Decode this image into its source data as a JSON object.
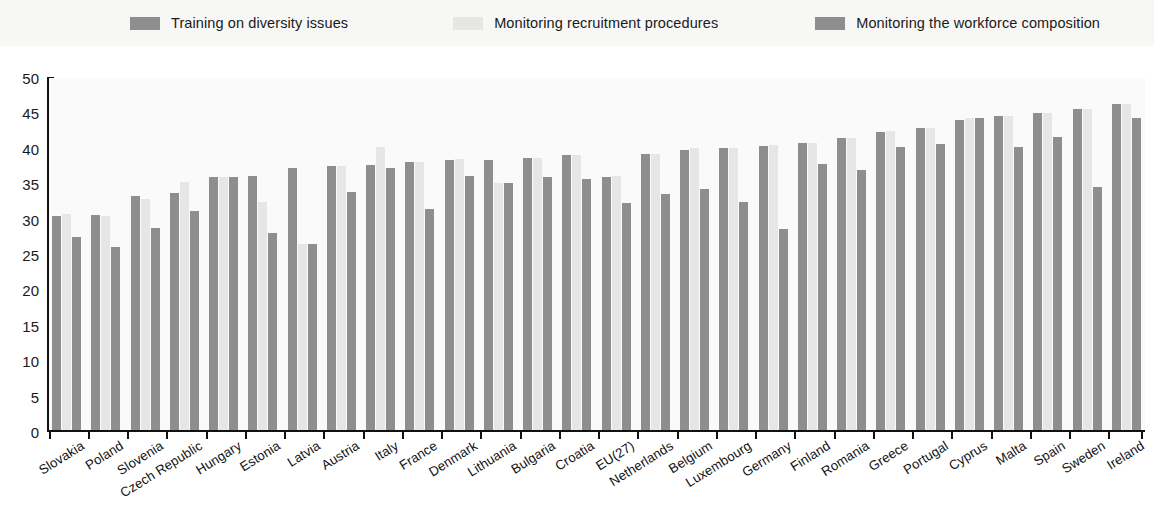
{
  "legend": {
    "entries": [
      {
        "label": "Training on diversity issues",
        "color": "#8e8e8e"
      },
      {
        "label": "Monitoring recruitment procedures",
        "color": "#e6e6e4"
      },
      {
        "label": "Monitoring the workforce composition",
        "color": "#8e8e8e"
      }
    ]
  },
  "axis": {
    "y_ticks": [
      "50",
      "45",
      "40",
      "35",
      "30",
      "25",
      "20",
      "15",
      "10",
      "5",
      "0"
    ]
  },
  "chart_data": {
    "type": "bar",
    "title": "",
    "subtitle": "",
    "xlabel": "",
    "ylabel": "",
    "ylim": [
      0,
      50
    ],
    "ytick_step": 5,
    "grid": false,
    "legend_position": "top",
    "orientation": "vertical",
    "grouping": "grouped",
    "categories": [
      "Slovakia",
      "Poland",
      "Slovenia",
      "Czech Republic",
      "Hungary",
      "Estonia",
      "Latvia",
      "Austria",
      "Italy",
      "France",
      "Denmark",
      "Lithuania",
      "Bulgaria",
      "Croatia",
      "EU(27)",
      "Netherlands",
      "Belgium",
      "Luxembourg",
      "Germany",
      "Finland",
      "Romania",
      "Greece",
      "Portugal",
      "Cyprus",
      "Malta",
      "Spain",
      "Sweden",
      "Ireland"
    ],
    "series": [
      {
        "name": "Training on diversity issues",
        "color": "#8e8e8e",
        "values": [
          30.2,
          30.3,
          33.1,
          33.5,
          35.7,
          35.9,
          37.0,
          37.3,
          37.5,
          37.9,
          38.1,
          38.1,
          38.4,
          38.9,
          35.8,
          39.0,
          39.5,
          39.8,
          40.1,
          40.5,
          41.2,
          42.1,
          42.6,
          43.8,
          44.3,
          44.8,
          45.4,
          46.1
        ]
      },
      {
        "name": "Monitoring recruitment procedures",
        "color": "#e6e6e4",
        "values": [
          30.5,
          30.2,
          32.6,
          35.0,
          35.8,
          32.2,
          26.3,
          37.3,
          40.0,
          37.9,
          38.3,
          34.9,
          38.4,
          38.9,
          35.9,
          39.0,
          39.9,
          39.8,
          40.2,
          40.5,
          41.3,
          42.2,
          42.7,
          44.0,
          44.3,
          44.8,
          45.4,
          46.1
        ]
      },
      {
        "name": "Monitoring the workforce composition",
        "color": "#8e8e8e",
        "values": [
          27.3,
          25.9,
          28.5,
          31.0,
          35.8,
          27.8,
          26.3,
          33.6,
          37.0,
          31.2,
          35.9,
          34.9,
          35.7,
          35.5,
          32.0,
          33.3,
          34.0,
          32.2,
          28.4,
          37.6,
          36.7,
          40.0,
          40.4,
          44.0,
          40.0,
          41.4,
          34.3,
          44.0
        ]
      }
    ]
  }
}
